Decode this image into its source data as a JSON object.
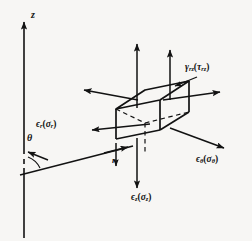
{
  "figure": {
    "type": "engineering-diagram",
    "background_color": "#f7f6f4",
    "ink_color": "#121212"
  },
  "axes": {
    "vertical_axis_label": "z",
    "angle_label": "θ",
    "radial_label": "r"
  },
  "components": {
    "axial_top": {
      "label_epsilon": "ϵ",
      "sub_epsilon": "z",
      "label_sigma": "σ",
      "sub_sigma": "z",
      "text": "ϵz(σz)",
      "direction": "up"
    },
    "shear": {
      "text_gamma": "γ",
      "sub_gamma": "rz",
      "text_tau": "τ",
      "sub_tau": "rz",
      "full": "γrz(τrz)"
    },
    "radial": {
      "text_epsilon": "ϵ",
      "sub_epsilon": "r",
      "text_sigma": "σ",
      "sub_sigma": "r",
      "full": "ϵr(σr)"
    },
    "hoop": {
      "text_epsilon": "ϵ",
      "sub_epsilon": "θ",
      "text_sigma": "σ",
      "sub_sigma": "θ",
      "full": "ϵθ(σθ)"
    },
    "axial_bottom": {
      "text_epsilon": "ϵ",
      "sub_epsilon": "z",
      "text_sigma": "σ",
      "sub_sigma": "z",
      "full": "ϵz(σz)"
    }
  },
  "labels": {
    "z_axis": "z",
    "theta": "θ",
    "r": "r",
    "shear_gamma": "γ",
    "shear_gamma_sub": "rz",
    "shear_tau": "τ",
    "shear_tau_sub": "rz",
    "radial_eps": "ϵ",
    "radial_eps_sub": "r",
    "radial_sig": "σ",
    "radial_sig_sub": "r",
    "hoop_eps": "ϵ",
    "hoop_eps_sub": "θ",
    "hoop_sig": "σ",
    "hoop_sig_sub": "θ",
    "axial_eps": "ϵ",
    "axial_eps_sub": "z",
    "axial_sig": "σ",
    "axial_sig_sub": "z",
    "open_paren": "(",
    "close_paren": ")"
  }
}
